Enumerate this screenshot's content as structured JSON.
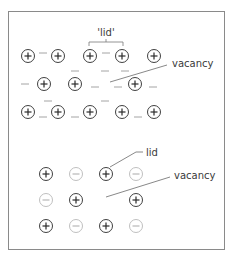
{
  "colors": {
    "frame": "#8a8a8a",
    "ion_positive": "#2a2a2a",
    "ion_negative_faded": "#b8b8b8",
    "dash": "#9a9a9a",
    "leader": "#6a6a6a",
    "text": "#3a3a3a"
  },
  "top_panel": {
    "bracket_label": "'lid'",
    "vacancy_label": "vacancy",
    "positive_ions": [
      {
        "x": 28,
        "y": 56
      },
      {
        "x": 58,
        "y": 56
      },
      {
        "x": 90,
        "y": 56
      },
      {
        "x": 122,
        "y": 56
      },
      {
        "x": 154,
        "y": 56
      },
      {
        "x": 44,
        "y": 84
      },
      {
        "x": 75,
        "y": 84
      },
      {
        "x": 135,
        "y": 84
      },
      {
        "x": 28,
        "y": 112
      },
      {
        "x": 58,
        "y": 112
      },
      {
        "x": 90,
        "y": 112
      },
      {
        "x": 122,
        "y": 112
      },
      {
        "x": 154,
        "y": 112
      }
    ],
    "negative_ions_dashes": [
      {
        "x": 43,
        "y": 53
      },
      {
        "x": 106,
        "y": 53
      },
      {
        "x": 75,
        "y": 71
      },
      {
        "x": 105,
        "y": 71
      },
      {
        "x": 125,
        "y": 71
      },
      {
        "x": 25,
        "y": 84
      },
      {
        "x": 95,
        "y": 87
      },
      {
        "x": 118,
        "y": 87
      },
      {
        "x": 153,
        "y": 87
      },
      {
        "x": 48,
        "y": 101
      },
      {
        "x": 105,
        "y": 101
      },
      {
        "x": 43,
        "y": 117
      },
      {
        "x": 75,
        "y": 117
      },
      {
        "x": 138,
        "y": 117
      }
    ]
  },
  "bottom_panel": {
    "lid_label": "lid",
    "vacancy_label": "vacancy",
    "ions": [
      {
        "x": 46,
        "y": 174,
        "charge": "+"
      },
      {
        "x": 76,
        "y": 174,
        "charge": "-"
      },
      {
        "x": 106,
        "y": 174,
        "charge": "+"
      },
      {
        "x": 136,
        "y": 174,
        "charge": "-"
      },
      {
        "x": 46,
        "y": 200,
        "charge": "-"
      },
      {
        "x": 76,
        "y": 200,
        "charge": "+"
      },
      {
        "x": 136,
        "y": 200,
        "charge": "+"
      },
      {
        "x": 46,
        "y": 226,
        "charge": "+"
      },
      {
        "x": 76,
        "y": 226,
        "charge": "-"
      },
      {
        "x": 106,
        "y": 226,
        "charge": "+"
      },
      {
        "x": 136,
        "y": 226,
        "charge": "-"
      }
    ]
  }
}
